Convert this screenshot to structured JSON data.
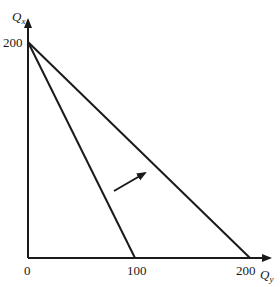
{
  "diagram": {
    "type": "budget-constraint-rotation",
    "axes": {
      "y_label": {
        "main": "Q",
        "sub": "x"
      },
      "x_label": {
        "main": "Q",
        "sub": "y"
      }
    },
    "ticks": {
      "y_200": "200",
      "origin": "0",
      "x_100": "100",
      "x_200": "200"
    },
    "lines": [
      {
        "name": "original-budget-line",
        "from": "(0, 200)",
        "to": "(100, 0)"
      },
      {
        "name": "new-budget-line",
        "from": "(0, 200)",
        "to": "(200, 0)"
      }
    ],
    "arrow": {
      "meaning": "outward rotation of budget line"
    },
    "colors": {
      "ink": "#1a1a1a",
      "background": "#ffffff"
    }
  }
}
